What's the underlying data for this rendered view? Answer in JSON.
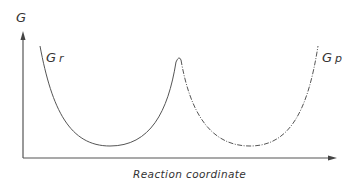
{
  "diagram": {
    "type": "energy-profile",
    "y_axis_label": "G",
    "x_axis_label": "Reaction coordinate",
    "curves": [
      {
        "label_main": "G",
        "label_sub": "r",
        "name": "reactant",
        "style": "solid",
        "minimum_x_px": 110
      },
      {
        "label_main": "G",
        "label_sub": "p",
        "name": "product",
        "style": "dashed",
        "minimum_x_px": 250
      }
    ],
    "crossing_peak": {
      "x_px": 179,
      "y_px": 57
    },
    "colors": {
      "line": "#444444",
      "text": "#333333",
      "background": "#ffffff"
    }
  }
}
